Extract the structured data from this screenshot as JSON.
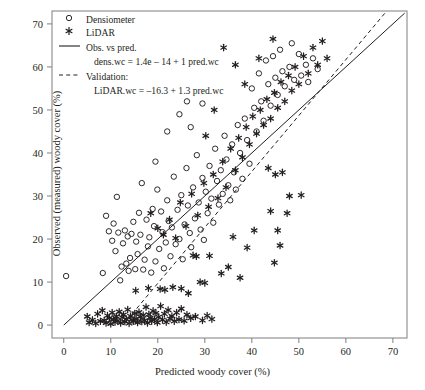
{
  "chart_data": {
    "type": "scatter",
    "title": "",
    "xlabel": "Predicted woody cover (%)",
    "ylabel": "Observed (measured) woody cover (%)",
    "xlim": [
      -2.5,
      73
    ],
    "ylim": [
      -3,
      73
    ],
    "xticks": [
      0,
      10,
      20,
      30,
      40,
      50,
      60,
      70
    ],
    "yticks": [
      0,
      10,
      20,
      30,
      40,
      50,
      60,
      70
    ],
    "grid": false,
    "legend_position": "top-left",
    "legend": [
      {
        "key": "densiometer",
        "label": "Densiometer",
        "marker": "open-circle"
      },
      {
        "key": "lidar",
        "label": "LiDAR",
        "marker": "asterisk"
      },
      {
        "key": "obs_vs_pred",
        "label": "Obs. vs pred.",
        "marker": "solid-line",
        "equation": "dens.wc = 1.4e – 14 + 1 pred.wc"
      },
      {
        "key": "validation",
        "label": "Validation:",
        "marker": "dashed-line",
        "equation": "LiDAR.wc = –16.3 + 1.3 pred.wc"
      }
    ],
    "lines": [
      {
        "name": "Obs. vs pred.",
        "style": "solid",
        "intercept": 0.0,
        "slope": 1.0,
        "x_from": 0,
        "x_to": 72.5,
        "color": "#231f20"
      },
      {
        "name": "Validation",
        "style": "dashed",
        "intercept": -16.3,
        "slope": 1.3,
        "x_from": 12.54,
        "x_to": 68.7,
        "color": "#231f20"
      }
    ],
    "series": [
      {
        "name": "Densiometer",
        "marker": "open-circle",
        "color": "#231f20",
        "points": [
          [
            0.5,
            11.4
          ],
          [
            8.3,
            12.1
          ],
          [
            9.0,
            25.4
          ],
          [
            9.6,
            21.8
          ],
          [
            10.3,
            19.6
          ],
          [
            10.6,
            23.6
          ],
          [
            11.0,
            17.2
          ],
          [
            11.3,
            29.8
          ],
          [
            11.6,
            21.5
          ],
          [
            12.0,
            10.4
          ],
          [
            12.3,
            13.6
          ],
          [
            12.6,
            19.0
          ],
          [
            13.0,
            22.0
          ],
          [
            13.3,
            14.3
          ],
          [
            13.6,
            20.6
          ],
          [
            13.8,
            12.6
          ],
          [
            14.1,
            15.6
          ],
          [
            14.4,
            21.2
          ],
          [
            14.8,
            24.0
          ],
          [
            15.2,
            13.0
          ],
          [
            15.4,
            19.4
          ],
          [
            15.7,
            16.5
          ],
          [
            16.0,
            26.1
          ],
          [
            16.3,
            21.0
          ],
          [
            16.6,
            33.0
          ],
          [
            16.9,
            12.9
          ],
          [
            17.2,
            15.2
          ],
          [
            17.6,
            24.5
          ],
          [
            17.9,
            18.3
          ],
          [
            18.2,
            20.4
          ],
          [
            18.6,
            12.2
          ],
          [
            18.9,
            27.0
          ],
          [
            19.2,
            23.0
          ],
          [
            19.5,
            14.8
          ],
          [
            19.9,
            31.5
          ],
          [
            20.3,
            17.7
          ],
          [
            20.7,
            26.4
          ],
          [
            21.0,
            21.6
          ],
          [
            21.3,
            13.2
          ],
          [
            21.7,
            19.2
          ],
          [
            22.0,
            29.0
          ],
          [
            22.3,
            24.2
          ],
          [
            22.7,
            16.0
          ],
          [
            23.0,
            22.7
          ],
          [
            23.4,
            34.5
          ],
          [
            23.8,
            18.8
          ],
          [
            24.2,
            26.8
          ],
          [
            24.6,
            20.0
          ],
          [
            25.0,
            30.2
          ],
          [
            25.3,
            15.3
          ],
          [
            25.7,
            23.4
          ],
          [
            26.1,
            36.5
          ],
          [
            26.4,
            27.8
          ],
          [
            26.8,
            21.4
          ],
          [
            27.1,
            18.1
          ],
          [
            27.5,
            32.0
          ],
          [
            27.9,
            24.8
          ],
          [
            28.3,
            39.5
          ],
          [
            28.7,
            28.5
          ],
          [
            29.1,
            22.2
          ],
          [
            29.5,
            34.2
          ],
          [
            29.8,
            19.8
          ],
          [
            30.2,
            31.0
          ],
          [
            30.6,
            26.0
          ],
          [
            31.0,
            37.0
          ],
          [
            31.4,
            29.4
          ],
          [
            31.8,
            23.8
          ],
          [
            32.2,
            41.0
          ],
          [
            32.6,
            33.5
          ],
          [
            33.0,
            28.0
          ],
          [
            33.4,
            36.0
          ],
          [
            33.8,
            30.5
          ],
          [
            34.2,
            44.0
          ],
          [
            34.6,
            38.5
          ],
          [
            35.0,
            32.5
          ],
          [
            35.4,
            29.0
          ],
          [
            35.8,
            42.0
          ],
          [
            36.2,
            35.5
          ],
          [
            36.6,
            31.5
          ],
          [
            37.0,
            46.5
          ],
          [
            37.5,
            40.0
          ],
          [
            38.0,
            34.0
          ],
          [
            38.5,
            48.0
          ],
          [
            39.0,
            43.0
          ],
          [
            39.5,
            37.5
          ],
          [
            40.0,
            55.0
          ],
          [
            40.5,
            50.5
          ],
          [
            41.0,
            45.0
          ],
          [
            41.5,
            58.5
          ],
          [
            42.0,
            52.0
          ],
          [
            42.5,
            47.5
          ],
          [
            43.0,
            61.5
          ],
          [
            43.5,
            56.0
          ],
          [
            44.0,
            51.0
          ],
          [
            44.5,
            62.5
          ],
          [
            45.0,
            57.5
          ],
          [
            45.5,
            53.5
          ],
          [
            46.0,
            64.0
          ],
          [
            46.5,
            59.0
          ],
          [
            47.0,
            55.5
          ],
          [
            48.0,
            60.0
          ],
          [
            48.5,
            65.5
          ],
          [
            49.0,
            57.0
          ],
          [
            50.0,
            63.0
          ],
          [
            50.5,
            58.0
          ],
          [
            51.5,
            60.5
          ],
          [
            52.0,
            56.5
          ],
          [
            53.0,
            62.0
          ],
          [
            54.0,
            59.5
          ],
          [
            24.6,
            49.0
          ],
          [
            26.2,
            52.0
          ],
          [
            27.0,
            46.0
          ],
          [
            29.5,
            51.5
          ],
          [
            22.0,
            45.0
          ],
          [
            19.5,
            38.0
          ]
        ]
      },
      {
        "name": "LiDAR",
        "marker": "asterisk",
        "color": "#231f20",
        "points": [
          [
            5.0,
            2.0
          ],
          [
            5.4,
            0.6
          ],
          [
            6.1,
            1.2
          ],
          [
            6.8,
            0.4
          ],
          [
            7.2,
            2.6
          ],
          [
            7.8,
            0.9
          ],
          [
            8.2,
            3.4
          ],
          [
            8.6,
            1.1
          ],
          [
            9.0,
            0.5
          ],
          [
            9.3,
            2.2
          ],
          [
            9.7,
            1.6
          ],
          [
            10.0,
            0.3
          ],
          [
            10.3,
            2.9
          ],
          [
            10.6,
            1.3
          ],
          [
            10.9,
            0.7
          ],
          [
            11.2,
            2.0
          ],
          [
            11.5,
            1.0
          ],
          [
            11.8,
            3.1
          ],
          [
            12.1,
            0.5
          ],
          [
            12.4,
            1.8
          ],
          [
            12.7,
            2.4
          ],
          [
            13.0,
            0.8
          ],
          [
            13.3,
            1.4
          ],
          [
            13.6,
            3.6
          ],
          [
            13.9,
            0.4
          ],
          [
            14.2,
            2.1
          ],
          [
            14.5,
            1.2
          ],
          [
            14.8,
            0.9
          ],
          [
            15.1,
            2.7
          ],
          [
            15.4,
            1.5
          ],
          [
            15.7,
            0.6
          ],
          [
            16.0,
            3.0
          ],
          [
            16.3,
            1.9
          ],
          [
            16.6,
            0.8
          ],
          [
            16.9,
            2.3
          ],
          [
            17.2,
            1.1
          ],
          [
            17.5,
            4.2
          ],
          [
            17.8,
            0.5
          ],
          [
            18.1,
            2.5
          ],
          [
            18.4,
            1.7
          ],
          [
            18.7,
            0.9
          ],
          [
            19.0,
            3.3
          ],
          [
            19.3,
            1.4
          ],
          [
            19.6,
            2.8
          ],
          [
            19.9,
            0.6
          ],
          [
            20.2,
            1.9
          ],
          [
            20.6,
            4.4
          ],
          [
            21.0,
            1.2
          ],
          [
            21.4,
            2.6
          ],
          [
            21.8,
            0.7
          ],
          [
            22.2,
            3.5
          ],
          [
            22.6,
            1.5
          ],
          [
            23.0,
            2.1
          ],
          [
            23.5,
            0.9
          ],
          [
            24.0,
            2.9
          ],
          [
            24.5,
            1.3
          ],
          [
            25.0,
            3.8
          ],
          [
            25.6,
            1.0
          ],
          [
            26.2,
            2.4
          ],
          [
            27.0,
            1.6
          ],
          [
            28.0,
            2.0
          ],
          [
            29.5,
            1.1
          ],
          [
            30.5,
            2.2
          ],
          [
            31.5,
            1.4
          ],
          [
            15.3,
            8.0
          ],
          [
            18.0,
            8.6
          ],
          [
            20.5,
            8.4
          ],
          [
            21.5,
            8.2
          ],
          [
            23.2,
            8.8
          ],
          [
            25.0,
            8.5
          ],
          [
            26.5,
            7.4
          ],
          [
            29.0,
            10.0
          ],
          [
            30.0,
            9.8
          ],
          [
            27.5,
            16.2
          ],
          [
            28.2,
            16.0
          ],
          [
            31.0,
            16.1
          ],
          [
            33.5,
            12.0
          ],
          [
            35.0,
            13.5
          ],
          [
            36.0,
            20.5
          ],
          [
            37.5,
            11.0
          ],
          [
            39.0,
            18.0
          ],
          [
            40.5,
            22.0
          ],
          [
            18.5,
            26.0
          ],
          [
            20.0,
            22.5
          ],
          [
            21.2,
            21.0
          ],
          [
            22.5,
            24.5
          ],
          [
            23.8,
            20.2
          ],
          [
            24.8,
            28.5
          ],
          [
            26.0,
            23.0
          ],
          [
            27.2,
            30.5
          ],
          [
            28.5,
            25.5
          ],
          [
            29.8,
            33.0
          ],
          [
            30.8,
            27.5
          ],
          [
            31.8,
            35.0
          ],
          [
            32.8,
            29.5
          ],
          [
            33.8,
            38.0
          ],
          [
            34.5,
            32.0
          ],
          [
            35.5,
            41.0
          ],
          [
            36.5,
            36.0
          ],
          [
            37.2,
            43.5
          ],
          [
            38.0,
            39.0
          ],
          [
            38.8,
            46.0
          ],
          [
            39.5,
            42.0
          ],
          [
            40.2,
            48.5
          ],
          [
            41.0,
            44.5
          ],
          [
            41.8,
            50.0
          ],
          [
            42.5,
            46.5
          ],
          [
            43.2,
            52.5
          ],
          [
            44.0,
            48.0
          ],
          [
            44.8,
            54.0
          ],
          [
            45.5,
            50.5
          ],
          [
            46.2,
            56.5
          ],
          [
            47.0,
            52.0
          ],
          [
            47.8,
            58.0
          ],
          [
            48.5,
            54.5
          ],
          [
            49.2,
            60.0
          ],
          [
            50.0,
            56.0
          ],
          [
            51.0,
            62.5
          ],
          [
            52.0,
            58.5
          ],
          [
            53.0,
            64.5
          ],
          [
            54.0,
            60.5
          ],
          [
            55.0,
            66.0
          ],
          [
            56.0,
            62.0
          ],
          [
            34.0,
            64.5
          ],
          [
            36.5,
            60.5
          ],
          [
            41.5,
            62.0
          ],
          [
            44.5,
            66.5
          ],
          [
            38.5,
            56.0
          ],
          [
            32.0,
            50.0
          ],
          [
            30.2,
            44.0
          ],
          [
            43.5,
            36.5
          ],
          [
            45.0,
            35.0
          ],
          [
            46.5,
            35.5
          ],
          [
            48.0,
            30.0
          ],
          [
            50.5,
            30.2
          ],
          [
            44.0,
            26.5
          ],
          [
            47.5,
            26.0
          ],
          [
            45.5,
            22.0
          ],
          [
            46.0,
            18.5
          ],
          [
            44.8,
            14.5
          ]
        ]
      }
    ]
  }
}
